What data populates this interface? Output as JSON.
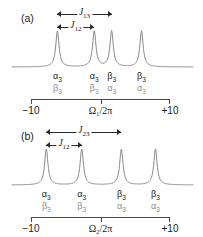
{
  "figure": {
    "type": "nmr-multiplet-spectra",
    "panels": [
      {
        "id": "a",
        "label": "(a)",
        "axis": {
          "left_label": "−10",
          "center_label": "Ω₁/2π",
          "right_label": "+10",
          "min": -10,
          "max": 10,
          "center": 0,
          "ticks": [
            -10,
            0,
            10
          ]
        },
        "couplings": [
          {
            "name": "J13",
            "label": "J",
            "sub": "13",
            "from_peak": 0,
            "to_peak": 2
          },
          {
            "name": "J12",
            "label": "J",
            "sub": "12",
            "from_peak": 0,
            "to_peak": 1
          }
        ],
        "peaks": [
          {
            "index": 0,
            "position": -6.2,
            "height": 1.0,
            "top_state": "α",
            "top_sub": "3",
            "bottom_state": "β",
            "bottom_sub": "3"
          },
          {
            "index": 1,
            "position": -0.9,
            "height": 1.0,
            "top_state": "α",
            "top_sub": "3",
            "bottom_state": "β",
            "bottom_sub": "3"
          },
          {
            "index": 2,
            "position": 1.6,
            "height": 1.0,
            "top_state": "β",
            "top_sub": "3",
            "bottom_state": "α",
            "bottom_sub": "3"
          },
          {
            "index": 3,
            "position": 5.9,
            "height": 1.0,
            "top_state": "β",
            "top_sub": "3",
            "bottom_state": "α",
            "bottom_sub": "3"
          }
        ]
      },
      {
        "id": "b",
        "label": "(b)",
        "axis": {
          "left_label": "−10",
          "center_label": "Ω₂/2π",
          "right_label": "+10",
          "min": -10,
          "max": 10,
          "center": 0,
          "ticks": [
            -10,
            0,
            10
          ]
        },
        "couplings": [
          {
            "name": "J23",
            "label": "J",
            "sub": "23",
            "from_peak": 0,
            "to_peak": 2
          },
          {
            "name": "J12",
            "label": "J",
            "sub": "12",
            "from_peak": 0,
            "to_peak": 1
          }
        ],
        "peaks": [
          {
            "index": 0,
            "position": -7.8,
            "height": 1.0,
            "top_state": "α",
            "top_sub": "3",
            "bottom_state": "β",
            "bottom_sub": "3"
          },
          {
            "index": 1,
            "position": -2.7,
            "height": 1.0,
            "top_state": "α",
            "top_sub": "3",
            "bottom_state": "β",
            "bottom_sub": "3"
          },
          {
            "index": 2,
            "position": 3.0,
            "height": 1.0,
            "top_state": "β",
            "top_sub": "3",
            "bottom_state": "α",
            "bottom_sub": "3"
          },
          {
            "index": 3,
            "position": 7.9,
            "height": 1.0,
            "top_state": "β",
            "top_sub": "3",
            "bottom_state": "α",
            "bottom_sub": "3"
          }
        ]
      }
    ],
    "colors": {
      "trace": "#8a8a8a",
      "axis": "#4a4a4a",
      "text_dark": "#1a1a1a",
      "text_light": "#8d8d8d",
      "arrow": "#2b2b2b",
      "background": "#ffffff"
    }
  },
  "chart_data": {
    "type": "line",
    "title": "",
    "subtitle": "",
    "xlabel": "",
    "ylabel": "",
    "grid": false,
    "legend": "none",
    "charts": [
      {
        "panel": "a",
        "xlabel": "Ω₁/2π",
        "xlim": [
          -10,
          10
        ],
        "xticks": [
          -10,
          0,
          10
        ],
        "xticklabels": [
          "−10",
          "Ω₁/2π",
          "+10"
        ],
        "peak_positions": [
          -6.2,
          -0.9,
          1.6,
          5.9
        ],
        "peak_heights": [
          1.0,
          1.0,
          1.0,
          1.0
        ],
        "peak_labels_top": [
          "α₃",
          "α₃",
          "β₃",
          "β₃"
        ],
        "peak_labels_bottom": [
          "β₃",
          "β₃",
          "α₃",
          "α₃"
        ],
        "annotations": [
          {
            "label": "J₁₃",
            "span": [
              -6.2,
              1.6
            ],
            "value": 7.8
          },
          {
            "label": "J₁₂",
            "span": [
              -6.2,
              -0.9
            ],
            "value": 5.3
          }
        ]
      },
      {
        "panel": "b",
        "xlabel": "Ω₂/2π",
        "xlim": [
          -10,
          10
        ],
        "xticks": [
          -10,
          0,
          10
        ],
        "xticklabels": [
          "−10",
          "Ω₂/2π",
          "+10"
        ],
        "peak_positions": [
          -7.8,
          -2.7,
          3.0,
          7.9
        ],
        "peak_heights": [
          1.0,
          1.0,
          1.0,
          1.0
        ],
        "peak_labels_top": [
          "α₃",
          "α₃",
          "β₃",
          "β₃"
        ],
        "peak_labels_bottom": [
          "β₃",
          "β₃",
          "α₃",
          "α₃"
        ],
        "annotations": [
          {
            "label": "J₂₃",
            "span": [
              -7.8,
              3.0
            ],
            "value": 10.8
          },
          {
            "label": "J₁₂",
            "span": [
              -7.8,
              -2.7
            ],
            "value": 5.1
          }
        ]
      }
    ]
  }
}
